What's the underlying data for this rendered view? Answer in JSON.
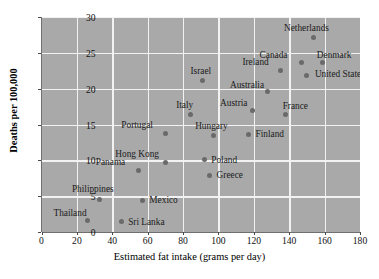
{
  "chart_data": {
    "type": "scatter",
    "title": "",
    "xlabel": "Estimated fat intake (grams per day)",
    "ylabel": "Deaths per 100,000",
    "xlim": [
      0,
      180
    ],
    "ylim": [
      0,
      30
    ],
    "xticks": [
      0,
      20,
      40,
      60,
      80,
      100,
      120,
      140,
      160,
      180
    ],
    "yticks": [
      0,
      5,
      10,
      15,
      20,
      25,
      30
    ],
    "grid": true,
    "legend": "none",
    "points": [
      {
        "label": "Thailand",
        "x": 26,
        "y": 1.6,
        "lx": -34,
        "ly": -13
      },
      {
        "label": "Sri Lanka",
        "x": 45,
        "y": 1.4,
        "lx": 7,
        "ly": -5
      },
      {
        "label": "Mexico",
        "x": 57,
        "y": 4.4,
        "lx": 7,
        "ly": -5
      },
      {
        "label": "Philippines",
        "x": 33,
        "y": 4.5,
        "lx": -28,
        "ly": -16
      },
      {
        "label": "Panama",
        "x": 55,
        "y": 8.6,
        "lx": -43,
        "ly": -13
      },
      {
        "label": "Hong Kong",
        "x": 70,
        "y": 9.7,
        "lx": -50,
        "ly": -13
      },
      {
        "label": "Greece",
        "x": 95,
        "y": 7.9,
        "lx": 7,
        "ly": -5
      },
      {
        "label": "Poland",
        "x": 92,
        "y": 10.1,
        "lx": 7,
        "ly": -5
      },
      {
        "label": "Portugal",
        "x": 70,
        "y": 13.7,
        "lx": -44,
        "ly": -14
      },
      {
        "label": "Hungary",
        "x": 97,
        "y": 13.5,
        "lx": -18,
        "ly": -14
      },
      {
        "label": "Finland",
        "x": 117,
        "y": 13.6,
        "lx": 7,
        "ly": -6
      },
      {
        "label": "Italy",
        "x": 84,
        "y": 16.4,
        "lx": -14,
        "ly": -14
      },
      {
        "label": "Austria",
        "x": 119,
        "y": 17.0,
        "lx": -32,
        "ly": -12
      },
      {
        "label": "France",
        "x": 138,
        "y": 16.4,
        "lx": -3,
        "ly": -13
      },
      {
        "label": "Israel",
        "x": 91,
        "y": 21.2,
        "lx": -12,
        "ly": -14
      },
      {
        "label": "Australia",
        "x": 128,
        "y": 19.6,
        "lx": -38,
        "ly": -12
      },
      {
        "label": "Ireland",
        "x": 135,
        "y": 22.6,
        "lx": -38,
        "ly": -13
      },
      {
        "label": "United States",
        "x": 150,
        "y": 21.8,
        "lx": 8,
        "ly": -7
      },
      {
        "label": "Canada",
        "x": 147,
        "y": 23.6,
        "lx": -42,
        "ly": -13
      },
      {
        "label": "Denmark",
        "x": 159,
        "y": 23.6,
        "lx": -6,
        "ly": -13
      },
      {
        "label": "Netherlands",
        "x": 154,
        "y": 27.2,
        "lx": -30,
        "ly": -14
      }
    ],
    "colors": {
      "plot_background": "#a9a9a9",
      "gridline": "#f2f2f2",
      "marker": "#6a6a6a",
      "text": "#111111",
      "page_background": "#ffffff"
    }
  }
}
